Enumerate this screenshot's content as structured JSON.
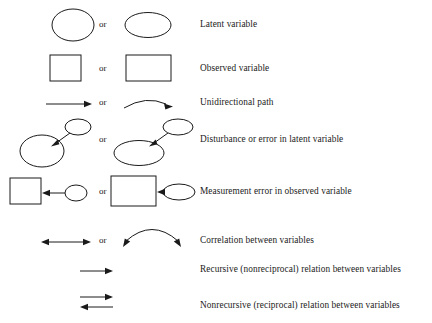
{
  "diagram": {
    "or_label": "or",
    "stroke_color": "#1a1a1a",
    "background_color": "#ffffff",
    "rows": [
      {
        "id": "latent-variable",
        "description": "Latent variable",
        "symbol_primary": "circle",
        "symbol_alternate": "ellipse",
        "has_or": true
      },
      {
        "id": "observed-variable",
        "description": "Observed variable",
        "symbol_primary": "square",
        "symbol_alternate": "rectangle",
        "has_or": true
      },
      {
        "id": "unidirectional-path",
        "description": "Unidirectional path",
        "symbol_primary": "straight-arrow",
        "symbol_alternate": "curved-arrow",
        "has_or": true
      },
      {
        "id": "disturbance-latent",
        "description": "Disturbance or error in latent variable",
        "symbol_primary": "small-ellipse-arrow-to-circle",
        "symbol_alternate": "small-ellipse-arrow-to-ellipse",
        "has_or": true
      },
      {
        "id": "measurement-error-observed",
        "description": "Measurement error in observed variable",
        "symbol_primary": "circle-arrow-to-square",
        "symbol_alternate": "ellipse-arrow-to-rectangle",
        "has_or": true
      },
      {
        "id": "correlation",
        "description": "Correlation between variables",
        "symbol_primary": "double-headed-straight-arrow",
        "symbol_alternate": "double-headed-curved-arc",
        "has_or": true
      },
      {
        "id": "recursive-relation",
        "description": "Recursive (nonreciprocal) relation between variables",
        "symbol_primary": "single-arrow",
        "symbol_alternate": null,
        "has_or": false
      },
      {
        "id": "nonrecursive-relation",
        "description": "Nonrecursive (reciprocal) relation between variables",
        "symbol_primary": "opposing-arrow-pair",
        "symbol_alternate": null,
        "has_or": false
      }
    ]
  }
}
